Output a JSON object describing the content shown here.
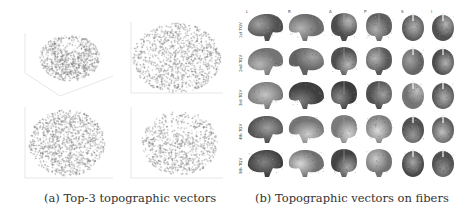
{
  "figure": {
    "panel_a": {
      "caption": "(a) Top-3 topographic vectors",
      "plots": [
        {
          "id": "3d-view",
          "type": "scatter3d"
        },
        {
          "id": "view-xy",
          "type": "scatter"
        },
        {
          "id": "view-xz",
          "type": "scatter"
        },
        {
          "id": "view-yz",
          "type": "scatter"
        }
      ]
    },
    "panel_b": {
      "caption": "(b) Topographic vectors on fibers",
      "column_labels": [
        "L",
        "R",
        "A",
        "P",
        "S",
        "I"
      ],
      "row_labels": [
        "1st TGV",
        "2nd TGV",
        "3rd TGV",
        "4th TGV",
        "5th TGV"
      ]
    }
  }
}
